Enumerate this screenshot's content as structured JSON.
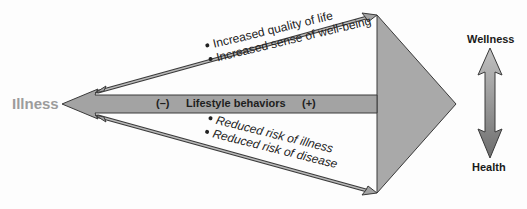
{
  "diagram": {
    "left_label": "Illness",
    "main_arrow": {
      "negative_marker": "(–)",
      "label": "Lifestyle behaviors",
      "positive_marker": "(+)"
    },
    "upper_benefits": [
      "Increased quality of life",
      "Increased sense of well-being"
    ],
    "lower_benefits": [
      "Reduced risk of illness",
      "Reduced risk of disease"
    ],
    "scale": {
      "top_label": "Wellness",
      "bottom_label": "Health",
      "icon": "double-headed-vertical-arrow"
    },
    "colors": {
      "arrow_fill": "#a3a3a3",
      "arrow_stroke": "#3a3a3a",
      "illness_text": "#9c9c9c",
      "text": "#1e1e1e"
    }
  }
}
